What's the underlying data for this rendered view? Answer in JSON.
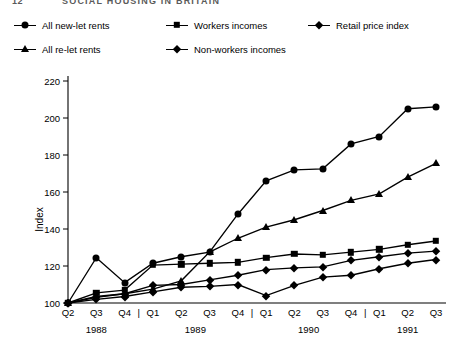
{
  "page": {
    "header_number": "12",
    "header_title": "SOCIAL HOUSING IN BRITAIN"
  },
  "legend": {
    "items": [
      {
        "label": "All new-let rents",
        "marker": "circle",
        "row": 0,
        "col": 0
      },
      {
        "label": "Workers incomes",
        "marker": "square",
        "row": 0,
        "col": 1
      },
      {
        "label": "Retail price index",
        "marker": "diamond",
        "row": 0,
        "col": 2
      },
      {
        "label": "All re-let rents",
        "marker": "triangle",
        "row": 1,
        "col": 0
      },
      {
        "label": "Non-workers incomes",
        "marker": "diamond",
        "row": 1,
        "col": 1
      }
    ]
  },
  "chart_data": {
    "type": "line",
    "title": "",
    "xlabel": "",
    "ylabel": "Index",
    "ylim": [
      100,
      220
    ],
    "ytick_step": 20,
    "yticks": [
      100,
      120,
      140,
      160,
      180,
      200,
      220
    ],
    "grid": false,
    "legend_position": "top",
    "categories": [
      "Q2",
      "Q3",
      "Q4",
      "Q1",
      "Q2",
      "Q3",
      "Q4",
      "Q1",
      "Q2",
      "Q3",
      "Q4",
      "Q1",
      "Q2",
      "Q3"
    ],
    "year_groups": [
      {
        "year": "1988",
        "start_index": 0,
        "end_index": 2
      },
      {
        "year": "1989",
        "start_index": 3,
        "end_index": 6
      },
      {
        "year": "1990",
        "start_index": 7,
        "end_index": 10
      },
      {
        "year": "1991",
        "start_index": 11,
        "end_index": 13
      }
    ],
    "separators_before_index": [
      3,
      7,
      11
    ],
    "series": [
      {
        "name": "All new-let rents",
        "marker": "circle",
        "values": [
          100,
          124.5,
          111,
          121.5,
          125,
          127.5,
          148,
          166,
          172,
          172.5,
          186,
          190,
          205,
          206
        ]
      },
      {
        "name": "All re-let rents",
        "marker": "triangle",
        "values": [
          100,
          103,
          105,
          107.5,
          112,
          127.5,
          135,
          141,
          145,
          150,
          155.5,
          159,
          168,
          175.5
        ]
      },
      {
        "name": "Workers incomes",
        "marker": "square",
        "values": [
          100,
          105.5,
          107,
          120.5,
          121,
          121.5,
          122,
          124.5,
          126.5,
          126,
          127.5,
          129,
          131.5,
          133.5
        ]
      },
      {
        "name": "Retail price index",
        "marker": "diamond",
        "values": [
          100,
          103.5,
          105,
          109.5,
          110,
          112.5,
          115,
          118,
          119,
          119.5,
          123,
          125,
          127,
          128
        ]
      },
      {
        "name": "Non-workers incomes",
        "marker": "diamond",
        "values": [
          100,
          102,
          103.5,
          106,
          108.5,
          109,
          110,
          104,
          109.5,
          114,
          115,
          118.5,
          121.5,
          123.5
        ]
      }
    ]
  }
}
